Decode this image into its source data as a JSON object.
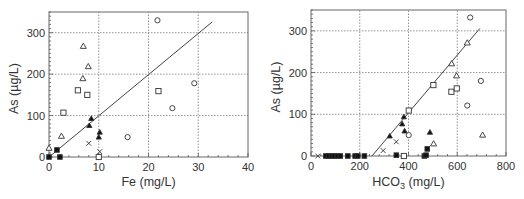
{
  "chart_data": [
    {
      "type": "scatter",
      "title": "",
      "xlabel": "Fe (mg/L)",
      "ylabel": "As (µg/L)",
      "xlim": [
        0,
        40
      ],
      "ylim": [
        0,
        350
      ],
      "xticks": [
        0,
        10,
        20,
        30,
        40
      ],
      "yticks": [
        0,
        100,
        200,
        300
      ],
      "grid": true,
      "legend": null,
      "fit_line": {
        "x": [
          0,
          32.8
        ],
        "y": [
          0,
          326
        ]
      },
      "series": [
        {
          "name": "open-triangle",
          "marker": "triangle-open",
          "points": [
            [
              6.9,
              267
            ],
            [
              7.9,
              218
            ],
            [
              6.8,
              189
            ],
            [
              2.5,
              50
            ],
            [
              0.0,
              21
            ]
          ]
        },
        {
          "name": "open-square",
          "marker": "square-open",
          "points": [
            [
              5.8,
              161
            ],
            [
              7.7,
              150
            ],
            [
              2.9,
              107
            ],
            [
              22.0,
              159
            ],
            [
              10.0,
              0
            ]
          ]
        },
        {
          "name": "open-circle",
          "marker": "circle-open",
          "points": [
            [
              21.8,
              330
            ],
            [
              29.2,
              178
            ],
            [
              24.8,
              118
            ],
            [
              15.8,
              48
            ]
          ]
        },
        {
          "name": "filled-triangle",
          "marker": "triangle-filled",
          "points": [
            [
              8.5,
              93
            ],
            [
              8.1,
              76
            ],
            [
              10.2,
              60
            ],
            [
              10.0,
              48
            ]
          ]
        },
        {
          "name": "filled-square",
          "marker": "square-filled",
          "points": [
            [
              0.0,
              0
            ],
            [
              1.6,
              17
            ],
            [
              2.2,
              0
            ]
          ]
        },
        {
          "name": "cross",
          "marker": "x",
          "points": [
            [
              8.0,
              33
            ],
            [
              10.2,
              13
            ]
          ]
        }
      ]
    },
    {
      "type": "scatter",
      "title": "",
      "xlabel": "HCO3 (mg/L)",
      "xlabel_main": "HCO",
      "xlabel_sub": "3",
      "xlabel_unit": " (mg/L)",
      "ylabel": "As (µg/L)",
      "xlim": [
        0,
        800
      ],
      "ylim": [
        0,
        350
      ],
      "xticks": [
        0,
        200,
        400,
        600,
        800
      ],
      "yticks": [
        0,
        100,
        200,
        300
      ],
      "grid": true,
      "legend": null,
      "fit_line": {
        "x": [
          250,
          693
        ],
        "y": [
          0,
          306
        ]
      },
      "series": [
        {
          "name": "open-triangle",
          "marker": "triangle-open",
          "points": [
            [
              641,
              271
            ],
            [
              577,
              221
            ],
            [
              597,
              192
            ],
            [
              704,
              50
            ],
            [
              503,
              29
            ]
          ]
        },
        {
          "name": "open-square",
          "marker": "square-open",
          "points": [
            [
              502,
              170
            ],
            [
              576,
              154
            ],
            [
              598,
              162
            ],
            [
              401,
              109
            ],
            [
              381,
              0
            ]
          ]
        },
        {
          "name": "open-circle",
          "marker": "circle-open",
          "points": [
            [
              653,
              332
            ],
            [
              697,
              180
            ],
            [
              641,
              121
            ],
            [
              401,
              50
            ]
          ]
        },
        {
          "name": "filled-triangle",
          "marker": "triangle-filled",
          "points": [
            [
              381,
              94
            ],
            [
              374,
              77
            ],
            [
              384,
              60
            ],
            [
              323,
              48
            ],
            [
              488,
              57
            ]
          ]
        },
        {
          "name": "filled-square",
          "marker": "square-filled",
          "points": [
            [
              61,
              0
            ],
            [
              72,
              0
            ],
            [
              84,
              0
            ],
            [
              95,
              0
            ],
            [
              108,
              0
            ],
            [
              120,
              0
            ],
            [
              151,
              0
            ],
            [
              181,
              0
            ],
            [
              192,
              0
            ],
            [
              219,
              0
            ],
            [
              350,
              2
            ],
            [
              465,
              0
            ],
            [
              472,
              2
            ],
            [
              477,
              17
            ]
          ]
        },
        {
          "name": "cross",
          "marker": "x",
          "points": [
            [
              28,
              0
            ],
            [
              350,
              34
            ],
            [
              296,
              13
            ]
          ]
        }
      ]
    }
  ]
}
